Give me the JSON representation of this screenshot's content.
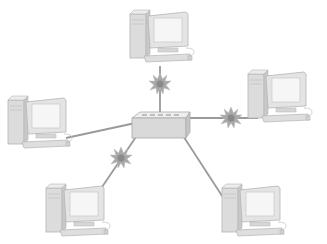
{
  "diagram": {
    "type": "star-network-topology",
    "canvas": {
      "width": 327,
      "height": 244,
      "background": "#ffffff"
    },
    "colors": {
      "cable": "#9a9a9a",
      "device_fill": "#e6e6e6",
      "device_shade": "#cfcfcf",
      "device_stroke": "#b5b5b5",
      "screen": "#f4f4f4",
      "burst": "#a8a8a8",
      "burst_core": "#8a8a8a",
      "arrow": "#333333"
    },
    "hub": {
      "name": "hub",
      "x": 132,
      "y": 112,
      "w": 58,
      "h": 26
    },
    "computers": [
      {
        "id": "pc-top",
        "x": 130,
        "y": 8,
        "scale": 1.0
      },
      {
        "id": "pc-right",
        "x": 248,
        "y": 68,
        "scale": 1.0
      },
      {
        "id": "pc-left",
        "x": 8,
        "y": 94,
        "scale": 1.0
      },
      {
        "id": "pc-bottom-left",
        "x": 46,
        "y": 182,
        "scale": 1.0
      },
      {
        "id": "pc-bottom-right",
        "x": 222,
        "y": 182,
        "scale": 1.0
      }
    ],
    "links": [
      {
        "from": "hub",
        "to": "pc-top",
        "x1": 160,
        "y1": 118,
        "x2": 160,
        "y2": 66,
        "collision": true
      },
      {
        "from": "hub",
        "to": "pc-right",
        "x1": 188,
        "y1": 118,
        "x2": 258,
        "y2": 118,
        "collision": true
      },
      {
        "from": "hub",
        "to": "pc-left",
        "x1": 140,
        "y1": 122,
        "x2": 66,
        "y2": 138,
        "collision": false
      },
      {
        "from": "hub",
        "to": "pc-bottom-left",
        "x1": 142,
        "y1": 128,
        "x2": 100,
        "y2": 190,
        "collision": true
      },
      {
        "from": "hub",
        "to": "pc-bottom-right",
        "x1": 178,
        "y1": 128,
        "x2": 226,
        "y2": 202,
        "collision": false
      }
    ],
    "collisions": [
      {
        "id": "burst-top",
        "x": 160,
        "y": 84
      },
      {
        "id": "burst-right",
        "x": 231,
        "y": 118
      },
      {
        "id": "burst-bottom-left",
        "x": 121,
        "y": 158
      }
    ]
  }
}
